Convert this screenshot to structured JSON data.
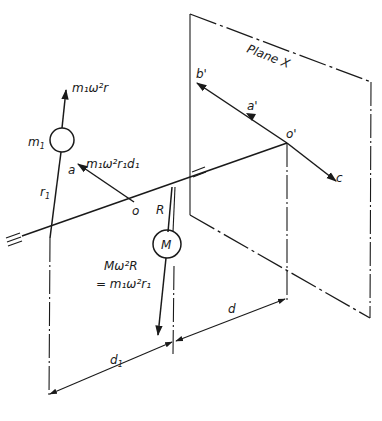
{
  "diagram": {
    "plane_label": "Plane X",
    "labels": {
      "m1": "m",
      "m1_sub": "1",
      "force_up": "m₁ω²r",
      "force_couple": "m₁ω²r₁d₁",
      "a": "a",
      "o": "o",
      "R": "R",
      "r1": "r",
      "r1_sub": "1",
      "M": "M",
      "balance_line1": "Mω²R",
      "balance_line2": "= m₁ω²r₁",
      "b_prime": "b'",
      "a_prime": "a'",
      "o_prime": "o'",
      "c": "c",
      "d": "d",
      "d1": "d",
      "d1_sub": "1",
      "eq_left": "=",
      "eq_mid": "="
    },
    "colors": {
      "ink": "#1a1a1a",
      "background": "#ffffff"
    }
  }
}
